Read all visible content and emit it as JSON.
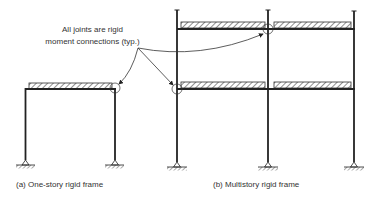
{
  "annotation": {
    "line1": "All joints are rigid",
    "line2": "moment connections (typ.)"
  },
  "captions": {
    "a": "(a)  One-story rigid frame",
    "b": "(b)  Multistory rigid frame"
  },
  "colors": {
    "line": "#222222",
    "hatch": "#444444",
    "background": "#ffffff"
  }
}
